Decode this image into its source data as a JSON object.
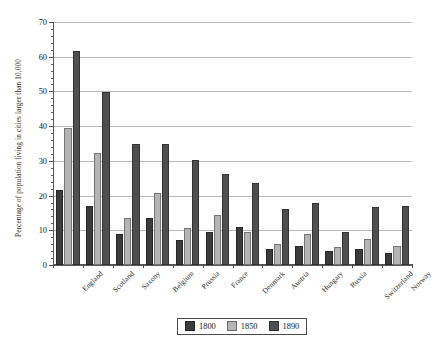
{
  "chart_data": {
    "type": "bar",
    "title": "",
    "xlabel": "",
    "ylabel": "Percentage of population living in cities larger than 10,000",
    "ylim": [
      0,
      70
    ],
    "ytick_step": 10,
    "yminor_step": 2,
    "grid": true,
    "legend_position": "bottom-center",
    "yticks": [
      "0",
      "10",
      "20",
      "30",
      "40",
      "50",
      "60",
      "70"
    ],
    "categories": [
      "England",
      "Scotland",
      "Saxony",
      "Belgium",
      "Prussia",
      "France",
      "Denmark",
      "Austria",
      "Hungary",
      "Russia",
      "Switzerland",
      "Norway"
    ],
    "series": [
      {
        "name": "1800",
        "color": "#3b3b3b",
        "values": [
          21.5,
          17.0,
          8.8,
          13.5,
          7.3,
          9.6,
          11.0,
          4.6,
          5.5,
          4.0,
          4.5,
          3.6
        ]
      },
      {
        "name": "1850",
        "color": "#b4b4b4",
        "values": [
          39.6,
          32.2,
          13.6,
          20.8,
          10.6,
          14.5,
          9.6,
          6.0,
          9.0,
          5.3,
          7.4,
          5.4
        ]
      },
      {
        "name": "1890",
        "color": "#4f4f4f",
        "values": [
          61.7,
          49.8,
          34.8,
          34.9,
          30.2,
          26.1,
          23.6,
          16.0,
          17.9,
          9.4,
          16.8,
          17.0
        ]
      }
    ]
  },
  "legend": {
    "entries": [
      {
        "label": "1800",
        "color": "#3b3b3b"
      },
      {
        "label": "1850",
        "color": "#b4b4b4"
      },
      {
        "label": "1890",
        "color": "#4f4f4f"
      }
    ]
  },
  "axes": {
    "y_title": "Percentage of population living in cities larger than 10,000"
  }
}
